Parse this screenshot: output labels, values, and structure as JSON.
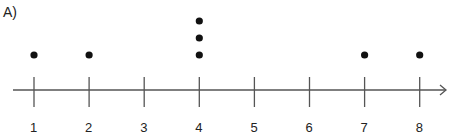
{
  "panel_label": "A)",
  "chart_data": {
    "type": "scatter",
    "subtype": "dot_plot",
    "title": "",
    "xlabel": "",
    "ylabel": "",
    "categories": [
      "1",
      "2",
      "3",
      "4",
      "5",
      "6",
      "7",
      "8"
    ],
    "counts": [
      1,
      1,
      0,
      3,
      0,
      0,
      1,
      1
    ],
    "points": [
      {
        "x": 1,
        "stack": 1
      },
      {
        "x": 2,
        "stack": 1
      },
      {
        "x": 4,
        "stack": 1
      },
      {
        "x": 4,
        "stack": 2
      },
      {
        "x": 4,
        "stack": 3
      },
      {
        "x": 7,
        "stack": 1
      },
      {
        "x": 8,
        "stack": 1
      }
    ],
    "xlim": [
      1,
      8
    ],
    "axis_arrow": "right",
    "grid": false
  },
  "colors": {
    "axis": "#555555",
    "dot": "#111111",
    "text": "#222222"
  }
}
